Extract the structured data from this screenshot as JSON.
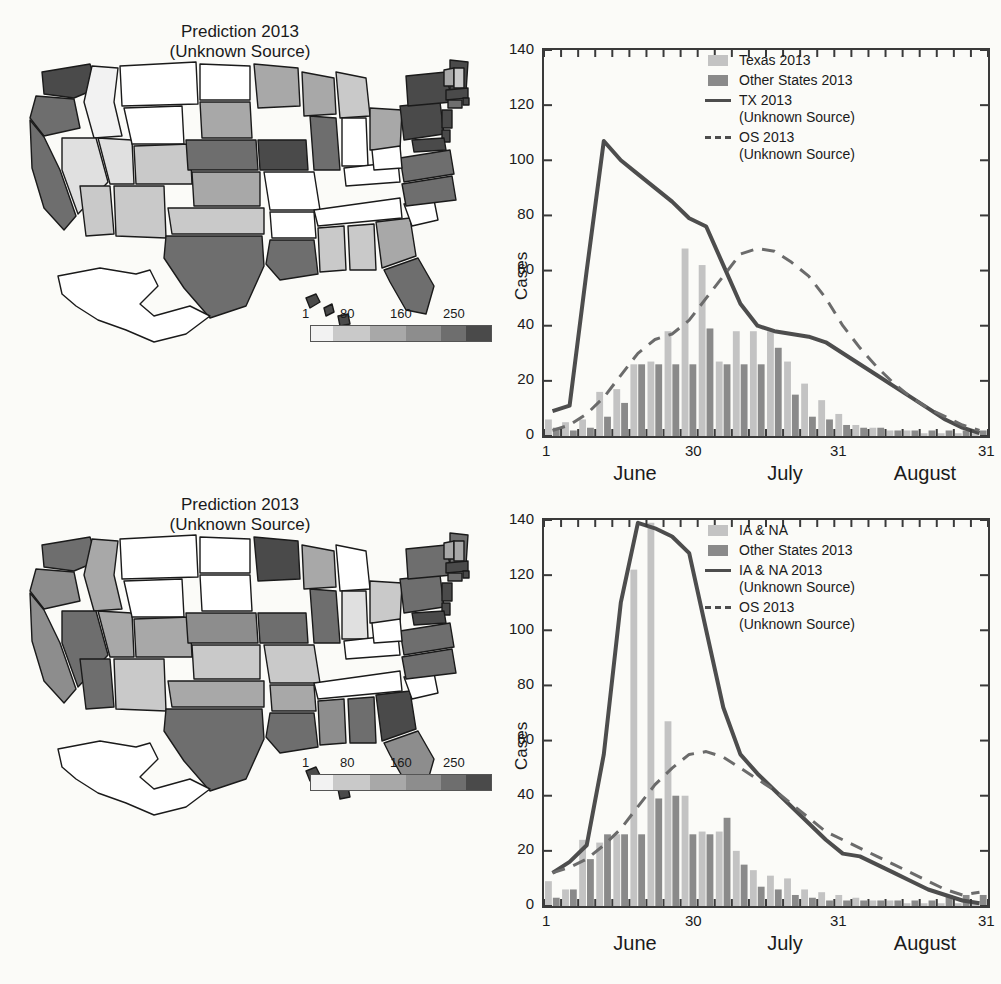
{
  "figure": {
    "maps": [
      {
        "title_line1": "Prediction 2013",
        "title_line2": "(Unknown Source)",
        "colorbar": {
          "ticks": [
            "1",
            "80",
            "160",
            "250"
          ]
        }
      },
      {
        "title_line1": "Prediction 2013",
        "title_line2": "(Unknown Source)",
        "colorbar": {
          "ticks": [
            "1",
            "80",
            "160",
            "250"
          ]
        }
      }
    ],
    "colors": {
      "bar_light": "#c3c3c3",
      "bar_dark": "#8a8a8a",
      "line_solid": "#4d4d4d",
      "line_dash": "#6b6b6b",
      "axis": "#3a3a3a"
    }
  },
  "chart_data": [
    {
      "type": "bar",
      "title": "",
      "xlabel": "",
      "ylabel": "Cases",
      "ylim": [
        0,
        140
      ],
      "yticks": [
        0,
        20,
        40,
        60,
        80,
        100,
        120,
        140
      ],
      "grid": false,
      "legend_position": "top-right",
      "x": [
        1,
        2,
        3,
        4,
        5,
        6,
        7,
        8,
        9,
        10,
        11,
        12,
        13,
        14,
        15,
        16,
        17,
        18,
        19,
        20,
        21,
        22,
        23,
        24,
        25,
        26
      ],
      "xtick_positions": [
        1,
        30,
        31,
        31
      ],
      "xtick_labels": [
        "1",
        "30",
        "31",
        "31"
      ],
      "month_labels": [
        "June",
        "July",
        "August"
      ],
      "series": [
        {
          "name": "Texas 2013",
          "kind": "bar",
          "color": "#c3c3c3",
          "values": [
            6,
            5,
            6,
            16,
            17,
            26,
            27,
            38,
            68,
            62,
            27,
            38,
            38,
            38,
            27,
            19,
            13,
            8,
            4,
            3,
            2,
            2,
            1,
            1,
            1,
            1
          ]
        },
        {
          "name": "Other States 2013",
          "kind": "bar",
          "color": "#8a8a8a",
          "values": [
            3,
            2,
            3,
            7,
            12,
            26,
            26,
            26,
            26,
            39,
            26,
            26,
            26,
            32,
            15,
            7,
            6,
            4,
            3,
            3,
            2,
            2,
            2,
            2,
            2,
            2
          ]
        },
        {
          "name": "TX 2013\n(Unknown Source)",
          "kind": "line",
          "style": "solid",
          "color": "#4d4d4d",
          "values": [
            9,
            11,
            60,
            107,
            100,
            95,
            90,
            85,
            79,
            76,
            62,
            48,
            40,
            38,
            37,
            36,
            34,
            30,
            26,
            22,
            18,
            14,
            10,
            6,
            3,
            1
          ]
        },
        {
          "name": "OS 2013\n(Unknown Source)",
          "kind": "line",
          "style": "dashed",
          "color": "#6b6b6b",
          "values": [
            2,
            4,
            8,
            14,
            22,
            30,
            35,
            37,
            42,
            50,
            58,
            66,
            68,
            67,
            63,
            58,
            50,
            40,
            32,
            25,
            19,
            14,
            10,
            7,
            4,
            2
          ]
        }
      ]
    },
    {
      "type": "bar",
      "title": "",
      "xlabel": "",
      "ylabel": "Cases",
      "ylim": [
        0,
        140
      ],
      "yticks": [
        0,
        20,
        40,
        60,
        80,
        100,
        120,
        140
      ],
      "grid": false,
      "legend_position": "top-right",
      "x": [
        1,
        2,
        3,
        4,
        5,
        6,
        7,
        8,
        9,
        10,
        11,
        12,
        13,
        14,
        15,
        16,
        17,
        18,
        19,
        20,
        21,
        22,
        23,
        24,
        25,
        26
      ],
      "xtick_positions": [
        1,
        30,
        31,
        31
      ],
      "xtick_labels": [
        "1",
        "30",
        "31",
        "31"
      ],
      "month_labels": [
        "June",
        "July",
        "August"
      ],
      "series": [
        {
          "name": "IA & NA",
          "kind": "bar",
          "color": "#c3c3c3",
          "values": [
            9,
            6,
            24,
            23,
            26,
            122,
            139,
            67,
            40,
            27,
            27,
            20,
            13,
            11,
            10,
            6,
            5,
            4,
            3,
            2,
            2,
            1,
            1,
            1,
            1,
            1
          ]
        },
        {
          "name": "Other States 2013",
          "kind": "bar",
          "color": "#8a8a8a",
          "values": [
            3,
            6,
            17,
            26,
            26,
            26,
            39,
            40,
            26,
            26,
            32,
            15,
            7,
            6,
            4,
            3,
            2,
            2,
            2,
            2,
            2,
            2,
            2,
            4,
            4,
            4
          ]
        },
        {
          "name": "IA & NA 2013\n(Unknown Source)",
          "kind": "line",
          "style": "solid",
          "color": "#4d4d4d",
          "values": [
            12,
            16,
            22,
            55,
            110,
            139,
            137,
            134,
            128,
            100,
            72,
            55,
            48,
            42,
            36,
            30,
            24,
            19,
            18,
            15,
            12,
            9,
            6,
            4,
            2,
            1
          ]
        },
        {
          "name": "OS 2013\n(Unknown Source)",
          "kind": "line",
          "style": "dashed",
          "color": "#6b6b6b",
          "values": [
            12,
            14,
            17,
            22,
            28,
            36,
            44,
            50,
            55,
            56,
            54,
            50,
            46,
            42,
            37,
            32,
            27,
            24,
            21,
            18,
            15,
            12,
            9,
            6,
            4,
            5
          ]
        }
      ]
    }
  ]
}
